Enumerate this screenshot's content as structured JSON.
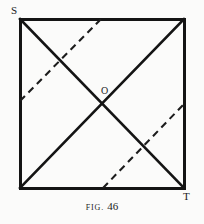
{
  "figure": {
    "caption_prefix": "FIG.",
    "caption_number": "46",
    "background_color": "#fbfbfa",
    "ink_color": "#141414"
  },
  "labels": {
    "top_left_vertex": "S",
    "bottom_right_vertex": "T",
    "center_point": "O"
  },
  "geometry": {
    "square": {
      "name": "outer-square",
      "left": 20,
      "top": 19,
      "right": 184,
      "bottom": 188,
      "stroke_width": 3,
      "color": "#141414"
    },
    "solid_diagonals": [
      {
        "name": "diagonal-S-to-bottom-right",
        "x1": 20,
        "y1": 19,
        "x2": 184,
        "y2": 188,
        "stroke_width": 2.6,
        "color": "#141414"
      },
      {
        "name": "diagonal-top-right-to-bottom-left",
        "x1": 184,
        "y1": 19,
        "x2": 20,
        "y2": 188,
        "stroke_width": 2.6,
        "color": "#141414"
      }
    ],
    "dashed_lines": [
      {
        "name": "dashed-upper-left",
        "x1": 20,
        "y1": 101,
        "x2": 101,
        "y2": 19,
        "stroke_width": 2.1,
        "color": "#1c1c1c",
        "dash_pattern": "7 5"
      },
      {
        "name": "dashed-lower-right",
        "x1": 103,
        "y1": 188,
        "x2": 184,
        "y2": 104,
        "stroke_width": 2.1,
        "color": "#1c1c1c",
        "dash_pattern": "7 5"
      }
    ],
    "intersection_point": {
      "name": "center-O",
      "x": 102,
      "y": 103
    }
  }
}
